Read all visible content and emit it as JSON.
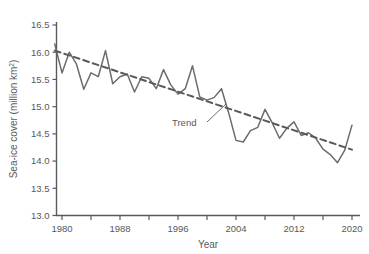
{
  "chart_data": {
    "type": "line",
    "title": "",
    "xlabel": "Year",
    "ylabel": "Sea-ice cover (million km²)",
    "ylabel_main": "Sea-ice cover (million km",
    "ylabel_sup": "2",
    "ylabel_tail": ")",
    "xlim": [
      1979,
      2021
    ],
    "ylim": [
      13.0,
      16.5
    ],
    "grid": false,
    "legend": false,
    "x_major_ticks": [
      1980,
      1988,
      1996,
      2004,
      2012,
      2020
    ],
    "x_minor_ticks": [
      1984,
      1992,
      2000,
      2008,
      2016
    ],
    "x_tick_labels": [
      "1980",
      "1988",
      "1996",
      "2004",
      "2012",
      "2020"
    ],
    "y_ticks": [
      13.0,
      13.5,
      14.0,
      14.5,
      15.0,
      15.5,
      16.0,
      16.5
    ],
    "y_tick_labels": [
      "13.0",
      "13.5",
      "14.0",
      "14.5",
      "15.0",
      "15.5",
      "16.0",
      "16.5"
    ],
    "series": [
      {
        "name": "Sea-ice cover",
        "style": "solid",
        "color": "#6b6c6e",
        "x": [
          1979,
          1980,
          1981,
          1982,
          1983,
          1984,
          1985,
          1986,
          1987,
          1988,
          1989,
          1990,
          1991,
          1992,
          1993,
          1994,
          1995,
          1996,
          1997,
          1998,
          1999,
          2000,
          2001,
          2002,
          2003,
          2004,
          2005,
          2006,
          2007,
          2008,
          2009,
          2010,
          2011,
          2012,
          2013,
          2014,
          2015,
          2016,
          2017,
          2018,
          2019,
          2020
        ],
        "values": [
          16.15,
          15.62,
          16.0,
          15.78,
          15.32,
          15.62,
          15.55,
          16.03,
          15.42,
          15.55,
          15.6,
          15.27,
          15.55,
          15.52,
          15.33,
          15.68,
          15.4,
          15.23,
          15.33,
          15.75,
          15.18,
          15.12,
          15.17,
          15.33,
          14.88,
          14.38,
          14.35,
          14.56,
          14.62,
          14.95,
          14.7,
          14.42,
          14.6,
          14.72,
          14.47,
          14.52,
          14.42,
          14.22,
          14.12,
          13.97,
          14.2,
          14.66
        ]
      },
      {
        "name": "Trend",
        "style": "dashed",
        "color": "#58595b",
        "x": [
          1979,
          2020
        ],
        "values": [
          16.03,
          14.21
        ]
      }
    ],
    "annotations": [
      {
        "text": "Trend",
        "x_px": 172,
        "y_px": 126,
        "leader_from": [
          207,
          122
        ],
        "leader_to": [
          226,
          104
        ]
      }
    ],
    "axis_color": "#58595b",
    "line_color": "#6b6c6e",
    "trend_color": "#58595b",
    "background": "#ffffff"
  }
}
